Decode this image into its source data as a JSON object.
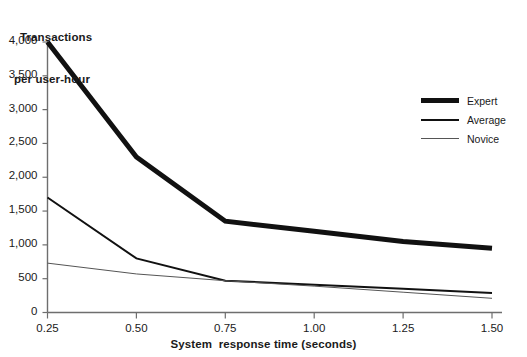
{
  "chart_data": {
    "type": "line",
    "title": "",
    "ylabel_line1": "Transactions",
    "ylabel_line2": "per user-hour",
    "xlabel": "System  response time (seconds)",
    "x": [
      0.25,
      0.5,
      0.75,
      1.0,
      1.25,
      1.5
    ],
    "xtick_labels": [
      "0.25",
      "0.50",
      "0.75",
      "1.00",
      "1.25",
      "1.50"
    ],
    "ytick_labels": [
      "0",
      "500",
      "1,000",
      "1,500",
      "2,000",
      "2,500",
      "3,000",
      "3,500",
      "4,000"
    ],
    "ytick_values": [
      0,
      500,
      1000,
      1500,
      2000,
      2500,
      3000,
      3500,
      4000
    ],
    "xlim": [
      0.25,
      1.5
    ],
    "ylim": [
      0,
      4000
    ],
    "grid": false,
    "legend_position": "right",
    "series": [
      {
        "name": "Expert",
        "values": [
          4000,
          2300,
          1350,
          1200,
          1050,
          950
        ],
        "color": "#111111",
        "line_width": 5
      },
      {
        "name": "Average",
        "values": [
          1700,
          800,
          470,
          410,
          350,
          290
        ],
        "color": "#111111",
        "line_width": 2
      },
      {
        "name": "Novice",
        "values": [
          730,
          570,
          470,
          390,
          300,
          210
        ],
        "color": "#555555",
        "line_width": 1
      }
    ]
  },
  "legend": {
    "items": [
      {
        "label": "Expert"
      },
      {
        "label": "Average"
      },
      {
        "label": "Novice"
      }
    ]
  },
  "axes": {
    "axis_color": "#6e6e6e",
    "tick_color": "#6e6e6e"
  }
}
